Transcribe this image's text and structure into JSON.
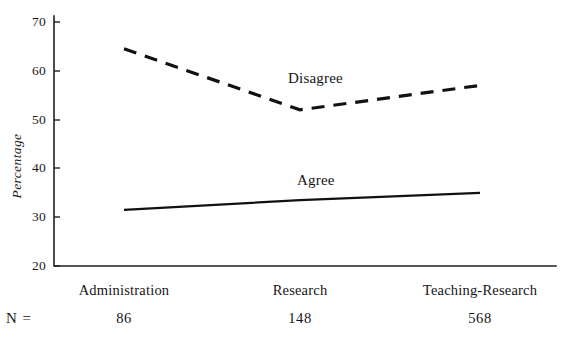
{
  "chart_data": {
    "type": "line",
    "title": "",
    "xlabel": "",
    "ylabel": "Percentage",
    "ylim": [
      20,
      70
    ],
    "yticks": [
      70,
      60,
      50,
      40,
      30,
      20
    ],
    "grid": false,
    "legend": "inline-labels",
    "categories": [
      "Administration",
      "Research",
      "Teaching-Research"
    ],
    "sample_sizes": [
      86,
      148,
      568
    ],
    "sample_size_legend": "N =",
    "series": [
      {
        "name": "Disagree",
        "style": "dashed",
        "values": [
          64.5,
          52.0,
          57.0
        ]
      },
      {
        "name": "Agree",
        "style": "solid",
        "values": [
          31.5,
          33.5,
          35.0
        ]
      }
    ]
  },
  "axis": {
    "tick_70": "70",
    "tick_60": "60",
    "tick_50": "50",
    "tick_40": "40",
    "tick_30": "30",
    "tick_20": "20",
    "y_title": "Percentage"
  },
  "labels": {
    "disagree": "Disagree",
    "agree": "Agree",
    "cat_1": "Administration",
    "cat_2": "Research",
    "cat_3": "Teaching-Research",
    "n_legend": "N =",
    "n_1": "86",
    "n_2": "148",
    "n_3": "568"
  },
  "colors": {
    "line": "#111111",
    "axis": "#222222",
    "text": "#151515",
    "background": "#ffffff"
  }
}
